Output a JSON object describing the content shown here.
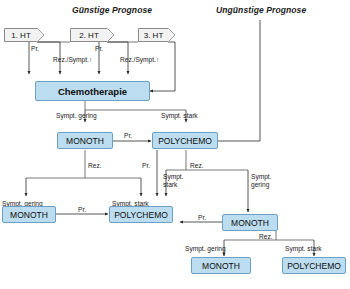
{
  "headers": {
    "favorable": "Günstige Prognose",
    "unfavorable": "Ungünstige Prognose"
  },
  "stages": [
    {
      "label": "1. HT"
    },
    {
      "label": "2. HT"
    },
    {
      "label": "3. HT"
    }
  ],
  "nodes": {
    "chemotherapie": "Chemotherapie",
    "mono_l2": "MONOTH",
    "poly_l2": "POLYCHEMO",
    "mono_l3": "MONOTH",
    "poly_l3": "POLYCHEMO",
    "mono_r3": "MONOTH",
    "mono_l4": "MONOTH",
    "poly_r4": "POLYCHEMO"
  },
  "edge_labels": {
    "pr_1": "Pr.",
    "pr_2": "Pr.",
    "rez_sympt_1": "Rez./Sympt.↑",
    "rez_sympt_2": "Rez./Sympt.↑",
    "sympt_gering_l2": "Sympt. gering",
    "sympt_stark_l2": "Sympt. stark",
    "pr_l2": "Pr.",
    "rez_l2": "Rez.",
    "pr_poly": "Pr.",
    "rez_poly": "Rez.",
    "sympt_stark_wrap": "Sympt. stark",
    "sympt_gering_wrap": "Sympt. gering",
    "sympt_gering_l3": "Sympt. gering",
    "sympt_stark_l3": "Sympt. stark",
    "pr_l3": "Pr.",
    "pr_r3": "Pr.",
    "rez_r3": "Rez.",
    "sympt_gering_l4": "Sympt. gering",
    "sympt_stark_r4": "Sympt. stark"
  },
  "colors": {
    "node_fill": "#bcdcf0",
    "node_stroke": "#6b9fc4",
    "stage_fill": "#f2f2f2",
    "stage_stroke": "#8a8a8a",
    "edge_stroke": "#3a3a3a",
    "background": "#ffffff"
  }
}
